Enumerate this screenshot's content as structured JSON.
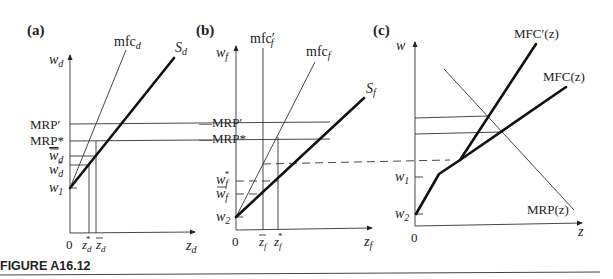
{
  "figure": {
    "caption": "FIGURE A16.12",
    "panels": {
      "a": {
        "tag": "(a)",
        "y_axis": "w_d",
        "x_axis": "z_d",
        "origin": "0",
        "curves": [
          "mfc_d",
          "S_d"
        ],
        "y_labels": [
          "MRP′",
          "MRP*",
          "w̄_d",
          "w*_d",
          "w_1"
        ],
        "x_labels": [
          "z*_d",
          "z̄_d"
        ]
      },
      "b": {
        "tag": "(b)",
        "y_axis": "w_f",
        "x_axis": "z_f",
        "origin": "0",
        "curves": [
          "mfc′_f",
          "mfc_f",
          "S_f"
        ],
        "y_labels": [
          "MRP′",
          "MRP*",
          "w*_f",
          "w̄_f",
          "w_2"
        ],
        "x_labels": [
          "z̄_f",
          "z*_f"
        ]
      },
      "c": {
        "tag": "(c)",
        "y_axis": "w",
        "x_axis": "z",
        "origin": "0",
        "curves": [
          "MFC′(z)",
          "MFC(z)",
          "MRP(z)"
        ],
        "y_labels": [
          "MRP′",
          "MRP*",
          "w_1",
          "w_2"
        ]
      }
    }
  },
  "text": {
    "a_tag_open": "(",
    "a_tag": "a",
    "a_tag_close": ")",
    "b_tag": "b",
    "c_tag": "c",
    "w": "w",
    "z": "z",
    "sub_d": "d",
    "sub_f": "f",
    "sub_1": "1",
    "sub_2": "2",
    "zero": "0",
    "mfc": "mfc",
    "S": "S",
    "mrp_prime": "MRP′",
    "mrp_star": "MRP*",
    "star": "*",
    "prime": "′",
    "MFC_prime_z": "MFC′(z)",
    "MFC_z": "MFC(z)",
    "MRP_z": "MRP(z)",
    "caption": "FIGURE A16.12"
  }
}
